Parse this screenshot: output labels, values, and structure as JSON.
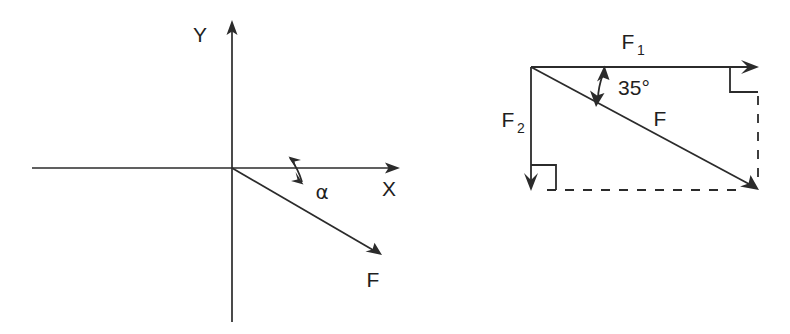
{
  "figure": {
    "background_color": "#ffffff",
    "line_color": "#2b2b2b",
    "width": 790,
    "height": 334
  },
  "left_panel": {
    "name": "coordinate-axes-force-panel",
    "axis_x_label": "X",
    "axis_y_label": "Y",
    "force_label": "F",
    "angle_label": "α",
    "description": "Cartesian axes with force F directed into the fourth quadrant at angle alpha below the positive X axis",
    "origin": {
      "x": 232,
      "y": 168
    },
    "x_axis": {
      "x1": 32,
      "y1": 168,
      "x2": 398,
      "y2": 168
    },
    "y_axis": {
      "x1": 232,
      "y1": 322,
      "x2": 232,
      "y2": 22
    },
    "force_vector": {
      "x1": 232,
      "y1": 168,
      "x2": 382,
      "y2": 255
    },
    "angle_degrees": 30
  },
  "right_panel": {
    "name": "force-triangle-panel",
    "component_horizontal_label": "F",
    "component_horizontal_sub": "1",
    "component_vertical_label": "F",
    "component_vertical_sub": "2",
    "resultant_label": "F",
    "angle_label": "35°",
    "angle_degrees": 35,
    "description": "Right triangle showing resultant F resolved into horizontal component F1 and vertical component F2, with 35 degree angle between F1 and F",
    "corner_top_left": {
      "x": 531,
      "y": 67
    },
    "corner_top_right": {
      "x": 758,
      "y": 67
    },
    "corner_bottom_left": {
      "x": 531,
      "y": 190
    },
    "corner_bottom_right": {
      "x": 758,
      "y": 190
    },
    "dashed_segments": [
      {
        "name": "bottom-dashed-baseline",
        "x1": 545,
        "y1": 190,
        "x2": 752,
        "y2": 190
      },
      {
        "name": "right-dashed-vertical",
        "x1": 758,
        "y1": 95,
        "x2": 758,
        "y2": 183
      }
    ]
  },
  "labels": {
    "left_axis_y": "Y",
    "left_axis_x": "X",
    "left_force": "F",
    "left_angle": "α",
    "right_f1_base": "F",
    "right_f1_sub": "1",
    "right_f2_base": "F",
    "right_f2_sub": "2",
    "right_resultant": "F",
    "right_angle": "35°"
  }
}
